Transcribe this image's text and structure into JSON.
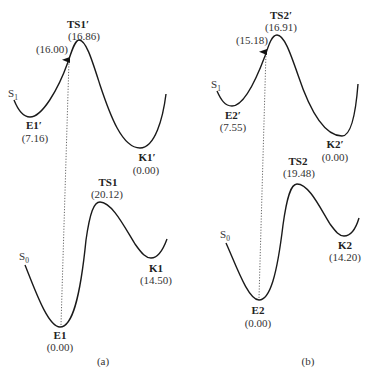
{
  "panels": [
    {
      "id": "a",
      "caption": "(a)",
      "upper_state": {
        "name": "S",
        "sub": "1"
      },
      "lower_state": {
        "name": "S",
        "sub": "0"
      },
      "points": {
        "E_prime": {
          "label": "E1′",
          "value": "(7.16)"
        },
        "TS_prime": {
          "label": "TS1′",
          "value": "(16.86)"
        },
        "K_prime": {
          "label": "K1′",
          "value": "(0.00)"
        },
        "vertical": {
          "value": "(16.00)"
        },
        "E": {
          "label": "E1",
          "value": "(0.00)"
        },
        "TS": {
          "label": "TS1",
          "value": "(20.12)"
        },
        "K": {
          "label": "K1",
          "value": "(14.50)"
        }
      }
    },
    {
      "id": "b",
      "caption": "(b)",
      "upper_state": {
        "name": "S",
        "sub": "1"
      },
      "lower_state": {
        "name": "S",
        "sub": "0"
      },
      "points": {
        "E_prime": {
          "label": "E2′",
          "value": "(7.55)"
        },
        "TS_prime": {
          "label": "TS2′",
          "value": "(16.91)"
        },
        "K_prime": {
          "label": "K2′",
          "value": "(0.00)"
        },
        "vertical": {
          "value": "(15.18)"
        },
        "E": {
          "label": "E2",
          "value": "(0.00)"
        },
        "TS": {
          "label": "TS2",
          "value": "(19.48)"
        },
        "K": {
          "label": "K2",
          "value": "(14.20)"
        }
      }
    }
  ],
  "colors": {
    "curve": "#1a1a1a",
    "text": "#222222",
    "background": "#ffffff"
  }
}
